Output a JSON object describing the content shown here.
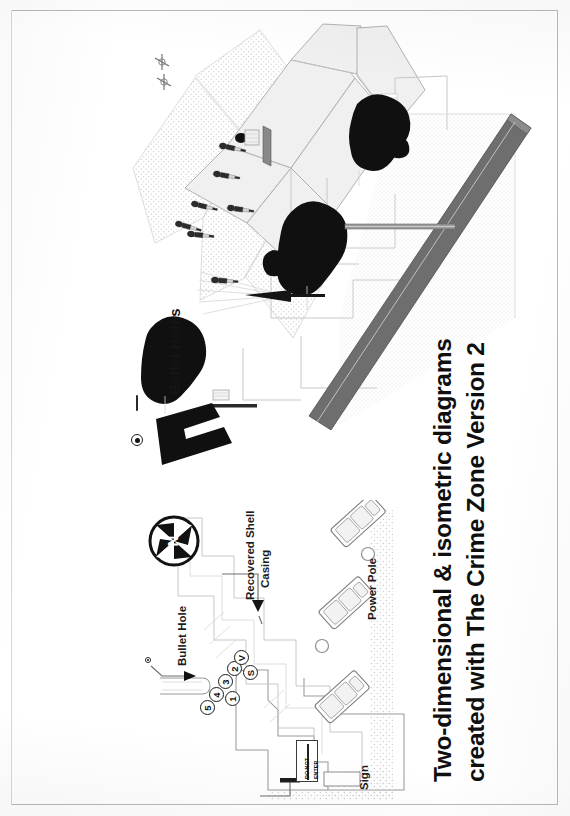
{
  "document": {
    "type": "scanned-page",
    "orientation": "landscape-content-rotated-90ccw",
    "background_color": "#ffffff",
    "frame_color": "#b9b9b9"
  },
  "title": {
    "line1": "Two-dimensional & isometric diagrams",
    "line2": "created with The Crime Zone Version 2"
  },
  "legend": {
    "bullet_holes_label": "Bullet Holes",
    "bullet_holes_dash": "—",
    "bullet_hole_symbol": "bullet-hole-target-dot"
  },
  "plan_view": {
    "labels": {
      "bullet_hole": "Bullet Hole",
      "recovered_shell_casing_line1": "Recovered Shell",
      "recovered_shell_casing_line2": "Casing",
      "power_pole": "Power Pole",
      "sign": "Sign"
    },
    "evidence_markers": [
      {
        "id": "m5",
        "label": "5"
      },
      {
        "id": "m4",
        "label": "4"
      },
      {
        "id": "m3",
        "label": "3"
      },
      {
        "id": "m2",
        "label": "2"
      },
      {
        "id": "mV",
        "label": "V"
      },
      {
        "id": "mS",
        "label": "S"
      },
      {
        "id": "m1",
        "label": "1"
      }
    ],
    "road_sign": {
      "text_line1": "DO NOT",
      "text_line2": "ENTER"
    },
    "compass": {
      "north_letter": "N",
      "name": "north-arrow-compass-rose"
    },
    "vehicles_count": 3,
    "power_poles_count": 2
  },
  "isometric_view": {
    "dark_vehicles_count": 3,
    "figures_count": 7,
    "has_building_blocks": true,
    "has_road_band": true,
    "colors": {
      "vehicle_fill": "#101010",
      "road_band": "#6e6e6e",
      "building_fill": "#f0f0f0",
      "hatch": "#cfcfcf"
    }
  }
}
